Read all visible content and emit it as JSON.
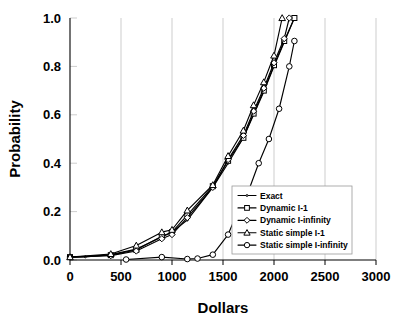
{
  "chart_data": {
    "type": "line",
    "title": "",
    "xlabel": "Dollars",
    "ylabel": "Probability",
    "xlim": [
      0,
      3000
    ],
    "ylim": [
      0,
      1.0
    ],
    "xticks": [
      0,
      500,
      1000,
      1500,
      2000,
      2500,
      3000
    ],
    "xtick_labels": [
      "0",
      "500",
      "1000",
      "1500",
      "2000",
      "2500",
      "3000"
    ],
    "yticks": [
      0.0,
      0.2,
      0.4,
      0.6,
      0.8,
      1.0
    ],
    "ytick_labels": [
      "0.0",
      "0.2",
      "0.4",
      "0.6",
      "0.8",
      "1.0"
    ],
    "grid": "vertical",
    "legend_position": "lower-right-inside",
    "line_color": "#000000",
    "marker_fill": "#ffffff",
    "series": [
      {
        "name": "Exact",
        "marker": "none",
        "x": [
          0,
          150,
          400,
          650,
          900,
          1000,
          1150,
          1400,
          1550,
          1700,
          1800,
          1900,
          2000,
          2100,
          2200
        ],
        "y": [
          0.012,
          0.013,
          0.022,
          0.045,
          0.095,
          0.115,
          0.165,
          0.3,
          0.4,
          0.505,
          0.6,
          0.695,
          0.8,
          0.9,
          1.0
        ]
      },
      {
        "name": "Dynamic I-1",
        "marker": "square",
        "x": [
          0,
          400,
          650,
          900,
          1000,
          1150,
          1400,
          1550,
          1700,
          1800,
          1900,
          2000,
          2100,
          2200
        ],
        "y": [
          0.012,
          0.02,
          0.042,
          0.098,
          0.115,
          0.185,
          0.305,
          0.41,
          0.505,
          0.605,
          0.7,
          0.805,
          0.905,
          1.0
        ]
      },
      {
        "name": "Dynamic I-infinity",
        "marker": "diamond",
        "x": [
          0,
          400,
          650,
          900,
          1000,
          1150,
          1400,
          1550,
          1700,
          1800,
          1900,
          2000,
          2100,
          2150
        ],
        "y": [
          0.012,
          0.018,
          0.037,
          0.088,
          0.105,
          0.175,
          0.3,
          0.415,
          0.515,
          0.615,
          0.71,
          0.815,
          0.915,
          1.0
        ]
      },
      {
        "name": "Static simple I-1",
        "marker": "triangle",
        "x": [
          0,
          400,
          650,
          900,
          1000,
          1150,
          1400,
          1550,
          1700,
          1800,
          1900,
          2000,
          2080
        ],
        "y": [
          0.012,
          0.025,
          0.06,
          0.115,
          0.125,
          0.205,
          0.31,
          0.43,
          0.535,
          0.64,
          0.735,
          0.845,
          1.0
        ]
      },
      {
        "name": "Static simple I-infinity",
        "marker": "circle",
        "x": [
          550,
          900,
          1150,
          1250,
          1400,
          1550,
          1650,
          1750,
          1850,
          1950,
          2050,
          2150,
          2200
        ],
        "y": [
          0.002,
          0.012,
          0.004,
          0.006,
          0.022,
          0.105,
          0.205,
          0.285,
          0.4,
          0.5,
          0.625,
          0.8,
          0.905
        ]
      }
    ]
  },
  "legend": {
    "items": [
      {
        "label": "Exact",
        "marker": "none"
      },
      {
        "label": "Dynamic I-1",
        "marker": "square"
      },
      {
        "label": "Dynamic I-infinity",
        "marker": "diamond"
      },
      {
        "label": "Static simple I-1",
        "marker": "triangle"
      },
      {
        "label": "Static simple I-infinity",
        "marker": "circle"
      }
    ]
  }
}
